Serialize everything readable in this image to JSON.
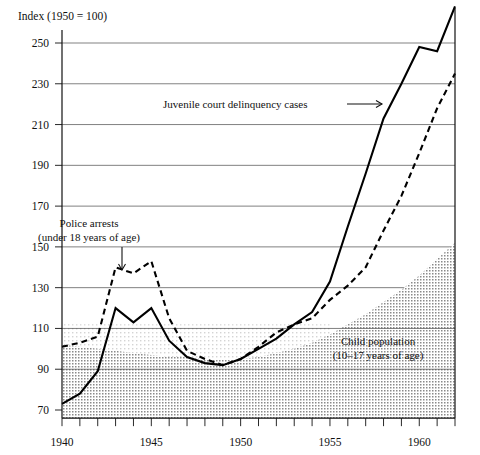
{
  "chart_data": {
    "type": "line",
    "title": "",
    "header_label": "Index (1950 = 100)",
    "xlabel": "",
    "ylabel": "",
    "xlim": [
      1940,
      1962
    ],
    "ylim": [
      66,
      272
    ],
    "grid": true,
    "legend_position": "inline-annotations",
    "x_ticks_major": [
      1940,
      1945,
      1950,
      1955,
      1960
    ],
    "x_ticks_minor_step": 1,
    "y_ticks": [
      70,
      90,
      110,
      130,
      150,
      170,
      190,
      210,
      230,
      250
    ],
    "x": [
      1940,
      1941,
      1942,
      1943,
      1944,
      1945,
      1946,
      1947,
      1948,
      1949,
      1950,
      1951,
      1952,
      1953,
      1954,
      1955,
      1956,
      1957,
      1958,
      1959,
      1960,
      1961,
      1962
    ],
    "series": [
      {
        "name": "Juvenile court delinquency cases",
        "style": "solid",
        "values": [
          73,
          78,
          89,
          120,
          113,
          120,
          104,
          96,
          93,
          92,
          95,
          100,
          105,
          112,
          118,
          133,
          160,
          186,
          213,
          230,
          248,
          246,
          268
        ]
      },
      {
        "name": "Police arrests (under 18 years of age)",
        "style": "dashed",
        "values": [
          101,
          103,
          106,
          140,
          137,
          143,
          115,
          99,
          95,
          92,
          95,
          101,
          108,
          112,
          115,
          124,
          131,
          140,
          158,
          175,
          196,
          218,
          235
        ]
      },
      {
        "name": "Child population (10-17 years of age)",
        "style": "filled-area",
        "values": [
          102,
          101,
          100,
          99,
          98,
          97,
          96,
          96,
          95,
          95,
          95,
          96,
          98,
          100,
          103,
          107,
          112,
          117,
          123,
          129,
          136,
          144,
          152
        ]
      }
    ],
    "annotations": [
      {
        "id": "juvenile-court-annotation",
        "text": "Juvenile court delinquency cases",
        "arrow": "right"
      },
      {
        "id": "police-arrests-annotation",
        "line1": "Police arrests",
        "line2": "(under 18 years of age)",
        "arrow": "down"
      },
      {
        "id": "child-population-annotation",
        "line1": "Child population",
        "line2": "(10–17 years of age)",
        "arrow": "none"
      }
    ],
    "colors": {
      "line": "#000000",
      "grid": "#4a4a4a",
      "area_fill": "#c8c8c8",
      "background": "#ffffff"
    }
  },
  "axis": {
    "y_tick_labels": [
      "250",
      "230",
      "210",
      "190",
      "170",
      "150",
      "130",
      "110",
      "90",
      "70"
    ],
    "x_tick_labels": [
      "1940",
      "1945",
      "1950",
      "1955",
      "1960"
    ]
  }
}
